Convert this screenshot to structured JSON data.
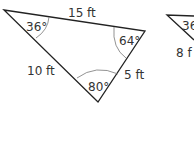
{
  "diagram": {
    "triangle_1": {
      "angles": {
        "top_left": "36°",
        "top_right": "64°",
        "bottom": "80°"
      },
      "sides": {
        "top": "15 ft",
        "left": "10 ft",
        "right": "5 ft"
      }
    },
    "triangle_2_partial": {
      "angle_label": "36",
      "side_label": "8 f"
    }
  }
}
